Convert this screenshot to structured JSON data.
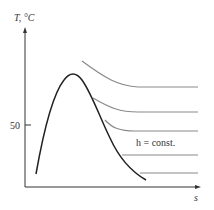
{
  "diagram": {
    "type": "T-s diagram",
    "y_axis_label": "T, °C",
    "x_axis_label": "s",
    "y_tick_label": "50",
    "curve_label": "h = const.",
    "colors": {
      "dome": "#222222",
      "isenthalps": "#8a8a8a",
      "axes": "#333333"
    },
    "isenthalp_count": 5
  }
}
